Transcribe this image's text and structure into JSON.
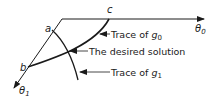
{
  "diagram": {
    "axes": {
      "theta0": {
        "symbol": "θ",
        "subscript": "0"
      },
      "theta1": {
        "symbol": "θ",
        "subscript": "1"
      }
    },
    "points": {
      "a": "a",
      "b": "b",
      "c": "c"
    },
    "labels": {
      "trace_g0_prefix": "Trace of ",
      "trace_g0_symbol": "g",
      "trace_g0_sub": "0",
      "desired_solution": "The desired solution",
      "trace_g1_prefix": "Trace of ",
      "trace_g1_symbol": "g",
      "trace_g1_sub": "1"
    },
    "colors": {
      "ink": "#1a1a1a",
      "background": "#ffffff"
    }
  }
}
